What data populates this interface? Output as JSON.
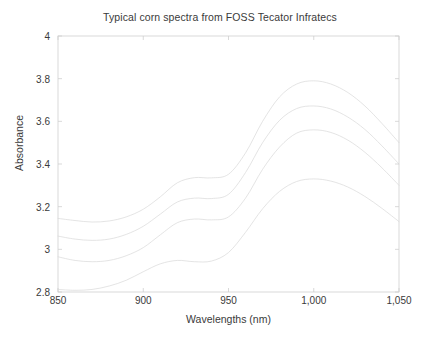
{
  "chart_data": {
    "type": "line",
    "title": "Typical corn spectra from FOSS Tecator Infratecs",
    "xlabel": "Wavelengths (nm)",
    "ylabel": "Absorbance",
    "xlim": [
      850,
      1050
    ],
    "ylim": [
      2.8,
      4
    ],
    "grid": false,
    "legend": null,
    "xticks": [
      850,
      900,
      950,
      1000,
      1050
    ],
    "xtick_labels": [
      "850",
      "900",
      "950",
      "1,000",
      "1,050"
    ],
    "yticks": [
      2.8,
      3,
      3.2,
      3.4,
      3.6,
      3.8,
      4
    ],
    "ytick_labels": [
      "2.8",
      "3",
      "3.2",
      "3.4",
      "3.6",
      "3.8",
      "4"
    ],
    "line_color": "#d8d8d8",
    "line_width": 0.7,
    "x": [
      850,
      860,
      870,
      880,
      890,
      900,
      910,
      920,
      930,
      940,
      950,
      960,
      970,
      980,
      990,
      1000,
      1010,
      1020,
      1030,
      1040,
      1050
    ],
    "series": [
      {
        "name": "spectrum-1",
        "values": [
          3.145,
          3.135,
          3.128,
          3.133,
          3.152,
          3.188,
          3.246,
          3.312,
          3.336,
          3.335,
          3.352,
          3.452,
          3.6,
          3.715,
          3.775,
          3.79,
          3.775,
          3.735,
          3.672,
          3.59,
          3.5
        ]
      },
      {
        "name": "spectrum-2",
        "values": [
          3.062,
          3.048,
          3.042,
          3.048,
          3.07,
          3.108,
          3.165,
          3.222,
          3.24,
          3.238,
          3.258,
          3.36,
          3.5,
          3.605,
          3.66,
          3.672,
          3.658,
          3.62,
          3.562,
          3.485,
          3.4
        ]
      },
      {
        "name": "spectrum-3",
        "values": [
          2.965,
          2.948,
          2.942,
          2.948,
          2.97,
          3.008,
          3.068,
          3.125,
          3.142,
          3.138,
          3.152,
          3.24,
          3.375,
          3.48,
          3.545,
          3.56,
          3.548,
          3.512,
          3.455,
          3.382,
          3.3
        ]
      },
      {
        "name": "spectrum-4",
        "values": [
          2.812,
          2.808,
          2.812,
          2.828,
          2.855,
          2.895,
          2.932,
          2.948,
          2.942,
          2.945,
          2.985,
          3.08,
          3.19,
          3.272,
          3.318,
          3.33,
          3.32,
          3.292,
          3.248,
          3.192,
          3.13
        ]
      }
    ]
  }
}
